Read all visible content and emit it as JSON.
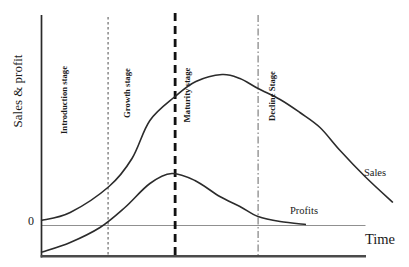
{
  "figure": {
    "background": "#ffffff"
  },
  "labels": {
    "ylabel": "Sales & profit",
    "xlabel": "Time",
    "zero": "0",
    "sales_curve": "Sales",
    "profits_curve": "Profits"
  },
  "colors": {
    "y_axis": "#2a2a2a",
    "x_axis": "#4a4a4a",
    "zero_line": "#909090",
    "curve": "#2b2b2b",
    "text": "#1a1a1a",
    "stage_line_fine": "#4d4d4d",
    "stage_line_heavy": "#111111",
    "stage_line_dashdot": "#666666"
  },
  "chart_data": {
    "type": "line",
    "xlabel": "Time",
    "ylabel": "Sales & profit",
    "y_tick_labels": [
      "0"
    ],
    "x_axis_span_t": [
      0,
      10
    ],
    "zero_line_v": 0,
    "stages": [
      {
        "label": "Introduction stage",
        "label_t": 0.74,
        "boundary_t": null,
        "boundary_style": null
      },
      {
        "label": "Growth stage",
        "label_t": 2.69,
        "boundary_t": 2.07,
        "boundary_style": "fine-dash"
      },
      {
        "label": "Maturity stage",
        "label_t": 4.54,
        "boundary_t": 4.14,
        "boundary_style": "heavy-dash"
      },
      {
        "label": "Decline Stage",
        "label_t": 7.16,
        "boundary_t": 6.7,
        "boundary_style": "dash-dot"
      }
    ],
    "series": [
      {
        "name": "Sales",
        "points": [
          [
            0,
            0.05
          ],
          [
            0.9,
            0.13
          ],
          [
            2.1,
            0.39
          ],
          [
            2.81,
            0.67
          ],
          [
            3.36,
            1.05
          ],
          [
            4.14,
            1.29
          ],
          [
            4.78,
            1.44
          ],
          [
            5.59,
            1.51
          ],
          [
            6.14,
            1.47
          ],
          [
            6.7,
            1.37
          ],
          [
            7.38,
            1.26
          ],
          [
            7.99,
            1.13
          ],
          [
            8.61,
            0.98
          ],
          [
            9.23,
            0.75
          ],
          [
            10.0,
            0.49
          ],
          [
            10.86,
            0.23
          ]
        ]
      },
      {
        "name": "Profits",
        "points": [
          [
            0,
            -0.27
          ],
          [
            0.9,
            -0.17
          ],
          [
            1.82,
            -0.02
          ],
          [
            2.59,
            0.18
          ],
          [
            3.36,
            0.42
          ],
          [
            4.04,
            0.52
          ],
          [
            4.75,
            0.45
          ],
          [
            5.52,
            0.29
          ],
          [
            6.14,
            0.19
          ],
          [
            6.7,
            0.09
          ],
          [
            7.38,
            0.04
          ],
          [
            8.18,
            0.01
          ]
        ]
      }
    ]
  }
}
